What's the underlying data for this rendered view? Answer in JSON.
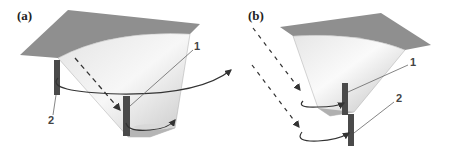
{
  "figure": {
    "panels": [
      {
        "id": "a",
        "label": "(a)",
        "parts": [
          {
            "id": "1",
            "label": "1",
            "description": "rod at bottom of funnel"
          },
          {
            "id": "2",
            "label": "2",
            "description": "rod at upper left edge of funnel"
          }
        ],
        "arrows": [
          "dashed diagonal arrow into funnel",
          "long curved arrow from rod 2 to right",
          "short curved arrow around rod 1"
        ]
      },
      {
        "id": "b",
        "label": "(b)",
        "parts": [
          {
            "id": "1",
            "label": "1",
            "description": "upper rod at funnel tip"
          },
          {
            "id": "2",
            "label": "2",
            "description": "lower rod below funnel tip"
          }
        ],
        "arrows": [
          "two dashed diagonal arrows",
          "curved arrow around rod 1",
          "curved arrow around rod 2"
        ]
      }
    ],
    "colors": {
      "plate": "#8f8f8f",
      "funnel_light": "#f2f2f2",
      "funnel_shade": "#d0d0d0",
      "rod": "#4a4a4a",
      "arrow": "#333333",
      "leader": "#666666"
    }
  }
}
